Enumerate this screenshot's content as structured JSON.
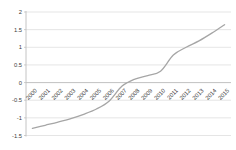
{
  "chart_data": {
    "type": "line",
    "title": "",
    "xlabel": "",
    "ylabel": "",
    "categories": [
      "2000",
      "2001",
      "2002",
      "2003",
      "2004",
      "2005",
      "2006",
      "2007",
      "2008",
      "2009",
      "2010",
      "2011",
      "2012",
      "2013",
      "2014",
      "2015"
    ],
    "series": [
      {
        "name": "series-1",
        "values": [
          -1.3,
          -1.21,
          -1.12,
          -1.02,
          -0.9,
          -0.75,
          -0.52,
          -0.1,
          0.1,
          0.2,
          0.32,
          0.78,
          1.0,
          1.18,
          1.4,
          1.64
        ]
      }
    ],
    "ylim": [
      -1.5,
      2
    ],
    "ytick_step": 0.5,
    "yticks": [
      2,
      1.5,
      1,
      0.5,
      0,
      -0.5,
      -1,
      -1.5
    ],
    "grid": true,
    "legend": "none",
    "x_label_rotation_deg": -45,
    "colors": {
      "line": "#a6a6a6",
      "gridline": "#dcdcdc",
      "axis": "#bdbdbd",
      "text": "#3b3b3b",
      "background": "#ffffff"
    }
  }
}
